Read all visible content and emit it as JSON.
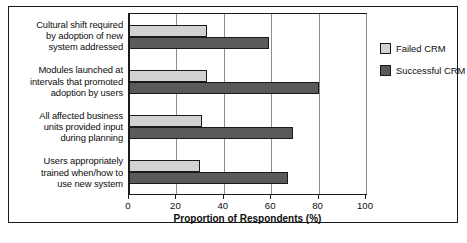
{
  "chart_data": {
    "type": "bar",
    "orientation": "horizontal",
    "title": "",
    "xlabel": "Proportion of Respondents (%)",
    "ylabel": "",
    "xlim": [
      0,
      100
    ],
    "xticks": [
      0,
      20,
      40,
      60,
      80,
      100
    ],
    "xtick_labels": [
      "0",
      "20",
      "40",
      "60",
      "80",
      "100"
    ],
    "grid": true,
    "legend_position": "right",
    "categories": [
      "Cultural shift required by adoption of new system addressed",
      "Modules launched at intervals that promoted adoption by users",
      "All affected business units provided input during planning",
      "Users appropriately trained when/how to use new system"
    ],
    "category_lines": [
      [
        "Cultural shift required",
        "by adoption of new",
        "system addressed"
      ],
      [
        "Modules launched at",
        "intervals that promoted",
        "adoption by users"
      ],
      [
        "All affected business",
        "units provided input",
        "during planning"
      ],
      [
        "Users appropriately",
        "trained when/how to",
        "use new system"
      ]
    ],
    "series": [
      {
        "name": "Failed CRM",
        "color": "#d2d2d2",
        "values": [
          33,
          33,
          31,
          30
        ]
      },
      {
        "name": "Successful CRM",
        "color": "#5a5a5a",
        "values": [
          59,
          80,
          69,
          67
        ]
      }
    ]
  },
  "legend": {
    "items": [
      {
        "label": "Failed CRM",
        "swatch": "failed"
      },
      {
        "label": "Successful CRM",
        "swatch": "successful"
      }
    ]
  },
  "axis": {
    "x_title": "Proportion of Respondents (%)",
    "tick_labels": [
      "0",
      "20",
      "40",
      "60",
      "80",
      "100"
    ]
  }
}
